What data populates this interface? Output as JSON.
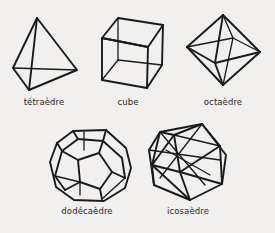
{
  "diagram": {
    "background": "#f1f0ee",
    "line_color": "#1a1a1a",
    "solids": [
      {
        "name": "tetraedre",
        "label": "tétraèdre",
        "faces": 4
      },
      {
        "name": "cube",
        "label": "cube",
        "faces": 6
      },
      {
        "name": "octaedre",
        "label": "octaèdre",
        "faces": 8
      },
      {
        "name": "dodecaedre",
        "label": "dodécaèdre",
        "faces": 12
      },
      {
        "name": "icosaedre",
        "label": "icosaèdre",
        "faces": 20
      }
    ]
  }
}
